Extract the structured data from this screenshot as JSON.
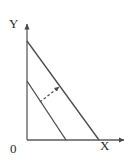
{
  "figure": {
    "kind": "line-diagram",
    "background_color": "#ffffff",
    "stroke_color": "#4a4a4a",
    "text_color": "#2b2b2b",
    "width": 135,
    "height": 164,
    "labels": {
      "y_axis": "Y",
      "x_axis": "X",
      "origin": "0"
    },
    "axes": {
      "origin_point": [
        27,
        140
      ],
      "y_axis_top": [
        27,
        22
      ],
      "x_axis_right": [
        126,
        140
      ],
      "arrowheads": [
        "y-axis-up",
        "x-axis-right"
      ]
    },
    "lines": [
      {
        "name": "outer-line",
        "style": "solid",
        "y_intercept_point": [
          27,
          41
        ],
        "x_intercept_point": [
          99,
          140
        ]
      },
      {
        "name": "inner-line",
        "style": "solid",
        "y_intercept_point": [
          27,
          81
        ],
        "x_intercept_point": [
          66,
          140
        ]
      }
    ],
    "shift_arrow": {
      "name": "outward-shift-arrow",
      "style": "dashed",
      "from_point": [
        40,
        102
      ],
      "to_point": [
        61,
        85
      ],
      "direction": "up-right"
    }
  }
}
